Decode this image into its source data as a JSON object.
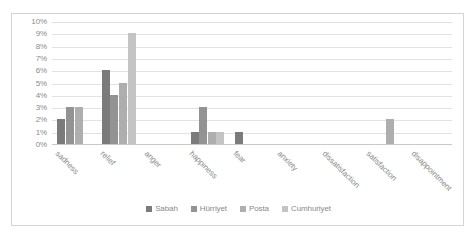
{
  "chart_data": {
    "type": "bar",
    "title": "",
    "subtitle": "",
    "xlabel": "",
    "ylabel": "",
    "grid": true,
    "legend_position": "bottom",
    "ylim": [
      0,
      10
    ],
    "ytick_labels": [
      "0%",
      "1%",
      "2%",
      "3%",
      "4%",
      "5%",
      "6%",
      "7%",
      "8%",
      "9%",
      "10%"
    ],
    "ytick_values": [
      0,
      1,
      2,
      3,
      4,
      5,
      6,
      7,
      8,
      9,
      10
    ],
    "categories": [
      "sadness",
      "relief",
      "anger",
      "happiness",
      "fear",
      "anxiety",
      "dissatisfaction",
      "satisfaction",
      "disappointment"
    ],
    "series": [
      {
        "name": "Sabah",
        "color": "#7b7b7b",
        "values": [
          2,
          6,
          0,
          1,
          1,
          0,
          0,
          0,
          0
        ]
      },
      {
        "name": "Hürriyet",
        "color": "#939393",
        "values": [
          3,
          4,
          0,
          3,
          0,
          0,
          0,
          0,
          0
        ]
      },
      {
        "name": "Posta",
        "color": "#aeaeae",
        "values": [
          3,
          5,
          0,
          1,
          0,
          0,
          0,
          2,
          0
        ]
      },
      {
        "name": "Cumhuriyet",
        "color": "#c4c4c4",
        "values": [
          0,
          9,
          0,
          1,
          0,
          0,
          0,
          0,
          0
        ]
      }
    ]
  },
  "legend": {
    "items": [
      {
        "label": "Sabah",
        "color": "#7b7b7b"
      },
      {
        "label": "Hürriyet",
        "color": "#939393"
      },
      {
        "label": "Posta",
        "color": "#aeaeae"
      },
      {
        "label": "Cumhuriyet",
        "color": "#c4c4c4"
      }
    ]
  }
}
